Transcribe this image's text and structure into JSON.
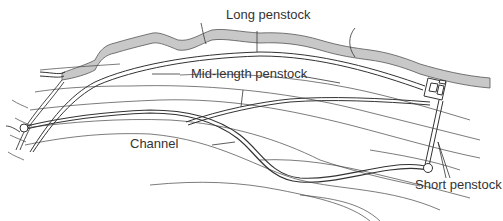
{
  "diagram": {
    "type": "hydropower-scheme-layout",
    "labels": {
      "long_penstock": "Long penstock",
      "mid_length_penstock": "Mid-length penstock",
      "channel": "Channel",
      "short_penstock": "Short penstock"
    },
    "colors": {
      "background": "#ffffff",
      "line": "#333333",
      "contour": "#444444",
      "river_fill": "#c8c8c8",
      "text": "#333333"
    },
    "elements": [
      {
        "name": "river",
        "kind": "shaded-band"
      },
      {
        "name": "contour-lines",
        "kind": "thin-lines"
      },
      {
        "name": "long-penstock",
        "kind": "double-line"
      },
      {
        "name": "mid-length-penstock",
        "kind": "double-line"
      },
      {
        "name": "channel",
        "kind": "double-line"
      },
      {
        "name": "short-penstock",
        "kind": "double-line"
      },
      {
        "name": "powerhouse",
        "kind": "box"
      },
      {
        "name": "intake",
        "kind": "circle"
      },
      {
        "name": "forebay",
        "kind": "circle"
      }
    ]
  }
}
